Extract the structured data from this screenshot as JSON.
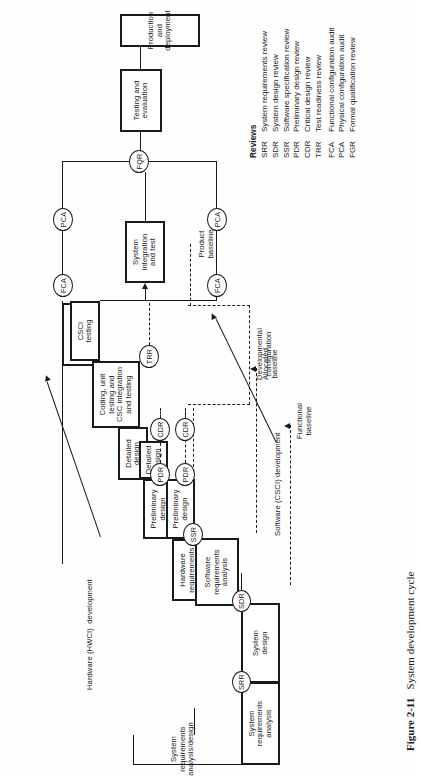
{
  "figure": {
    "number": "Figure 2-11",
    "caption": "System development cycle"
  },
  "legend": {
    "title": "Reviews",
    "items": [
      {
        "abbr": "SRR",
        "text": "System requirements review"
      },
      {
        "abbr": "SDR",
        "text": "System design review"
      },
      {
        "abbr": "SSR",
        "text": "Software specification review"
      },
      {
        "abbr": "PDR",
        "text": "Preliminary design review"
      },
      {
        "abbr": "CDR",
        "text": "Critical design review"
      },
      {
        "abbr": "TRR",
        "text": "Test readiness review"
      },
      {
        "abbr": "FCA",
        "text": "Functional  configuration audit"
      },
      {
        "abbr": "PCA",
        "text": "Physical configuration audit"
      },
      {
        "abbr": "FGR",
        "text": "Formal qualification review"
      }
    ]
  },
  "boxes": {
    "system_requirements_analysis": "System\nrequirements\nanalysis",
    "system_design": "System\ndesign",
    "hardware_requirements_analysis": "Hardware\nrequirements\nanalysis",
    "hw_preliminary_design": "Preliminary\ndesign",
    "hw_detailed_design": "Detailed\ndesign",
    "fabrication": "Fabrication",
    "hwci_testing": "HWCI\ntesting",
    "software_requirements_analysis": "Software\nrequirements\nanalysis",
    "sw_preliminary_design": "Preliminary\ndesign",
    "sw_detailed_design": "Detailed\ndesign",
    "coding_unit_csc": "Coding, unit\ntesting and\nCSC integration\nand testing",
    "csci_testing": "CSCI\ntesting",
    "system_integration_and_test": "System\nintegration\nand test",
    "testing_and_evaluation": "Testing and\nevaluation",
    "production_and_deployment": "Production and\ndeployment"
  },
  "review_nodes": {
    "srr": "SRR",
    "sdr": "SDR",
    "ssr": "SSR",
    "pdr_hw": "PDR",
    "pdr_sw": "PDR",
    "cdr_hw": "CDR",
    "cdr_sw": "CDR",
    "trr": "TRR",
    "fca_left": "FCA",
    "fca_right": "FCA",
    "pca_left": "PCA",
    "pca_right": "PCA",
    "fqr": "FQR"
  },
  "annotations": {
    "system_phase": "System\nrequirements\nanalysis/design",
    "hardware_track": "Hardware (HWCI)  development",
    "software_track": "Software (CSCI) development",
    "functional_baseline": "Functional\nbaseline",
    "allocated_baseline": "Allocated\nbaseline",
    "developmental_configuration": "Developmental\nconfiguration",
    "product_baseline": "Product\nbaseline"
  },
  "colors": {
    "ink": "#1a1a1a",
    "paper": "#fefefe"
  }
}
